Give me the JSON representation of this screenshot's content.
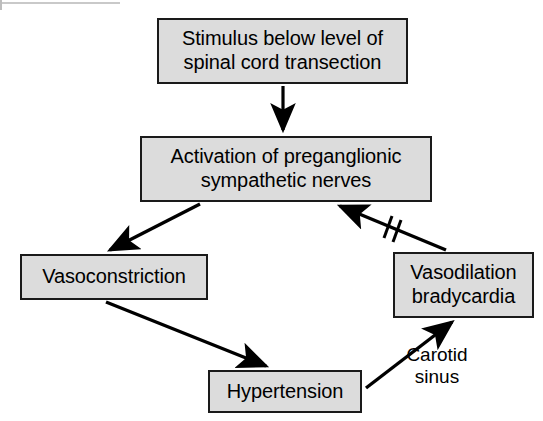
{
  "diagram": {
    "background_color": "#ffffff",
    "node_fill_color": "#dcdcdc",
    "node_border_color": "#1a1a1a",
    "edge_color": "#000000",
    "nodes": [
      {
        "id": "stimulus",
        "label": "Stimulus below level of\nspinal cord transection"
      },
      {
        "id": "activation",
        "label": "Activation of preganglionic\nsympathetic nerves"
      },
      {
        "id": "vasoconstriction",
        "label": "Vasoconstriction"
      },
      {
        "id": "vasodilation",
        "label": "Vasodilation\nbradycardia"
      },
      {
        "id": "hypertension",
        "label": "Hypertension"
      }
    ],
    "annotations": [
      {
        "id": "carotid-sinus",
        "label": "Carotid\nsinus"
      }
    ],
    "edges": [
      {
        "id": "stimulus-to-activation",
        "from": "stimulus",
        "to": "activation",
        "kind": "arrow"
      },
      {
        "id": "activation-to-vasoconstriction",
        "from": "activation",
        "to": "vasoconstriction",
        "kind": "arrow"
      },
      {
        "id": "vasoconstriction-to-hypertension",
        "from": "vasoconstriction",
        "to": "hypertension",
        "kind": "arrow"
      },
      {
        "id": "hypertension-to-vasodilation",
        "from": "hypertension",
        "to": "vasodilation",
        "kind": "arrow"
      },
      {
        "id": "vasodilation-to-activation",
        "from": "vasodilation",
        "to": "activation",
        "kind": "inhibited-arrow",
        "mark": "double-slash-break"
      }
    ]
  }
}
